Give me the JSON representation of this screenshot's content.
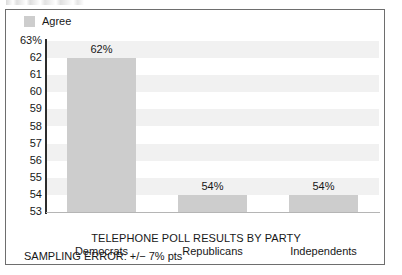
{
  "chart_data": {
    "type": "bar",
    "title": "",
    "xlabel": "TELEPHONE POLL RESULTS BY PARTY",
    "ylabel": "",
    "categories": [
      "Democrats",
      "Republicans",
      "Independents"
    ],
    "values": [
      62,
      54,
      54
    ],
    "value_labels": [
      "62%",
      "54%",
      "54%"
    ],
    "series": [
      {
        "name": "Agree",
        "values": [
          62,
          54,
          54
        ]
      }
    ],
    "ylim": [
      53,
      63
    ],
    "ytick_labels": [
      "63%",
      "62",
      "61",
      "60",
      "59",
      "58",
      "57",
      "56",
      "55",
      "54",
      "53"
    ],
    "ytick_values": [
      63,
      62,
      61,
      60,
      59,
      58,
      57,
      56,
      55,
      54,
      53
    ],
    "grid": "horizontal-alternating-bands",
    "legend": {
      "position": "top-left",
      "entries": [
        "Agree"
      ]
    },
    "annotation": "SAMPLING ERROR: +/− 7% pts",
    "colors": {
      "bar_fill": "#cdcdcd",
      "band_fill": "#f1f1f1",
      "frame": "#6e6e6e",
      "axis": "#2c2c2c",
      "text": "#171717"
    }
  },
  "legend": {
    "swatch_name": "agree-swatch",
    "label": "Agree"
  },
  "axis": {
    "title": "TELEPHONE POLL RESULTS BY PARTY"
  },
  "footnote": {
    "text": "SAMPLING ERROR: +/− 7% pts"
  }
}
